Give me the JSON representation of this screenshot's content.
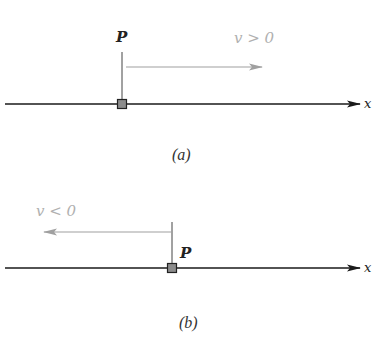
{
  "colors": {
    "axis": "#1a1a1a",
    "velocity_arrow": "#a0a0a0",
    "velocity_label": "#b0b0b0",
    "particle_fill": "#8c8c8c",
    "particle_stroke": "#222222",
    "marker": "#444444"
  },
  "panel_a": {
    "point_label": "P",
    "velocity_label": "v > 0",
    "axis_label": "x",
    "caption": "(a)"
  },
  "panel_b": {
    "point_label": "P",
    "velocity_label": "v < 0",
    "axis_label": "x",
    "caption": "(b)"
  }
}
